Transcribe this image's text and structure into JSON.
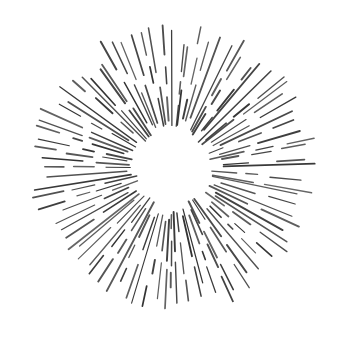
{
  "illustration": {
    "subject": "hand-drawn sunburst / starburst of radial dashed strokes",
    "background_color": "#ffffff",
    "stroke_color": "#333333",
    "ray_count": 88,
    "style": "sketchy radial dashes with empty circular center"
  }
}
